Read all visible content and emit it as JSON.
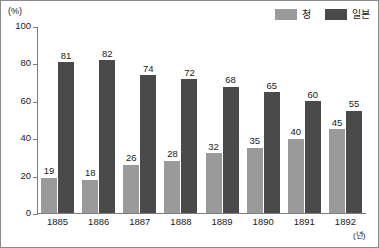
{
  "chart_data": {
    "type": "bar",
    "title": "",
    "xlabel": "(년)",
    "ylabel": "(%)",
    "categories": [
      "1885",
      "1886",
      "1887",
      "1888",
      "1889",
      "1890",
      "1891",
      "1892"
    ],
    "series": [
      {
        "name": "청",
        "color": "#9a9a9a",
        "values": [
          19,
          18,
          26,
          28,
          32,
          35,
          40,
          45
        ]
      },
      {
        "name": "일본",
        "color": "#4a4a4a",
        "values": [
          81,
          82,
          74,
          72,
          68,
          65,
          60,
          55
        ]
      }
    ],
    "ylim": [
      0,
      100
    ],
    "yticks": [
      0,
      20,
      40,
      60,
      80,
      100
    ],
    "ytick_labels": [
      "0",
      "20",
      "40",
      "60",
      "80",
      "100"
    ],
    "grid": false,
    "legend_position": "top-right",
    "show_value_labels": true
  },
  "axes": {
    "y_unit_label": "(%)",
    "x_unit_label": "(년)"
  }
}
